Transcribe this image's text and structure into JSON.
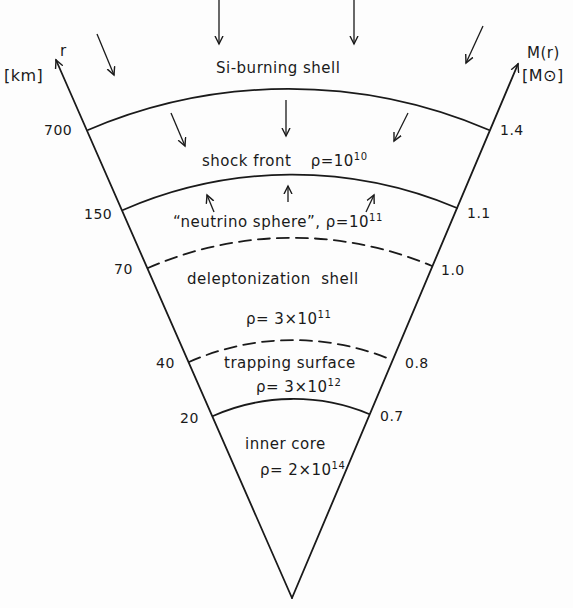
{
  "diagram": {
    "left_axis": {
      "symbol": "r",
      "unit": "[km]",
      "ticks": [
        "700",
        "150",
        "70",
        "40",
        "20"
      ]
    },
    "right_axis": {
      "symbol": "M(r)",
      "unit": "[M⊙]",
      "ticks": [
        "1.4",
        "1.1",
        "1.0",
        "0.8",
        "0.7"
      ]
    },
    "regions": [
      {
        "name": "Si-burning shell",
        "density": ""
      },
      {
        "name": "shock front",
        "density_prefix": "ρ=10",
        "density_exp": "10"
      },
      {
        "name": "“neutrino sphere”,",
        "density_prefix": "ρ=10",
        "density_exp": "11"
      },
      {
        "name": "deleptonization  shell",
        "density_prefix": "ρ= 3×10",
        "density_exp": "11"
      },
      {
        "name": "trapping surface",
        "density_prefix": "ρ= 3×10",
        "density_exp": "12"
      },
      {
        "name": "inner core",
        "density_prefix": "ρ= 2×10",
        "density_exp": "14"
      }
    ],
    "boundaries": [
      {
        "r_km": "700",
        "m": "1.4",
        "style": "solid"
      },
      {
        "r_km": "150",
        "m": "1.1",
        "style": "solid"
      },
      {
        "r_km": "70",
        "m": "1.0",
        "style": "dashed"
      },
      {
        "r_km": "40",
        "m": "0.8",
        "style": "dashed"
      },
      {
        "r_km": "20",
        "m": "0.7",
        "style": "solid"
      }
    ],
    "arrows": {
      "infall_outer": "inward arrows above Si-burning shell",
      "infall_inner": "inward arrows between Si-burning shell and shock front",
      "outward": "outward arrows from neutrino sphere toward shock front"
    }
  }
}
